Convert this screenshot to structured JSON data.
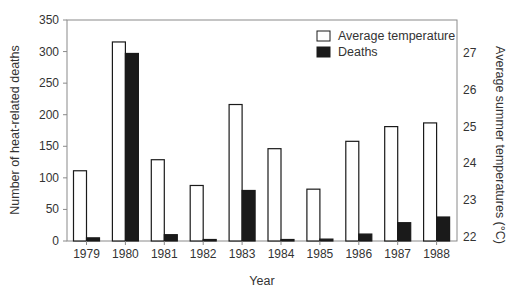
{
  "chart_data": {
    "type": "bar",
    "title": "",
    "xlabel": "Year",
    "ylabel": "Number of heat-related deaths",
    "y2label": "Average summer temperatures (°C)",
    "categories": [
      "1979",
      "1980",
      "1981",
      "1982",
      "1983",
      "1984",
      "1985",
      "1986",
      "1987",
      "1988"
    ],
    "series": [
      {
        "name": "Average temperature",
        "axis": "right",
        "fill": "#ffffff",
        "stroke": "#1a1a1a",
        "values": [
          23.8,
          27.3,
          24.1,
          23.4,
          25.6,
          24.4,
          23.3,
          24.6,
          25.0,
          25.1
        ]
      },
      {
        "name": "Deaths",
        "axis": "left",
        "fill": "#1a1a1a",
        "stroke": "#1a1a1a",
        "values": [
          5,
          297,
          10,
          1,
          80,
          2,
          3,
          11,
          29,
          38
        ]
      }
    ],
    "ylim": [
      0,
      350
    ],
    "yticks": [
      0,
      50,
      100,
      150,
      200,
      250,
      300,
      350
    ],
    "y2lim": [
      22,
      27
    ],
    "y2ticks": [
      22,
      23,
      24,
      25,
      26,
      27
    ],
    "y2_baseline_offset": -0.1,
    "grid": false,
    "legend": {
      "position": "top-right",
      "entries": [
        "Average temperature",
        "Deaths"
      ]
    }
  }
}
